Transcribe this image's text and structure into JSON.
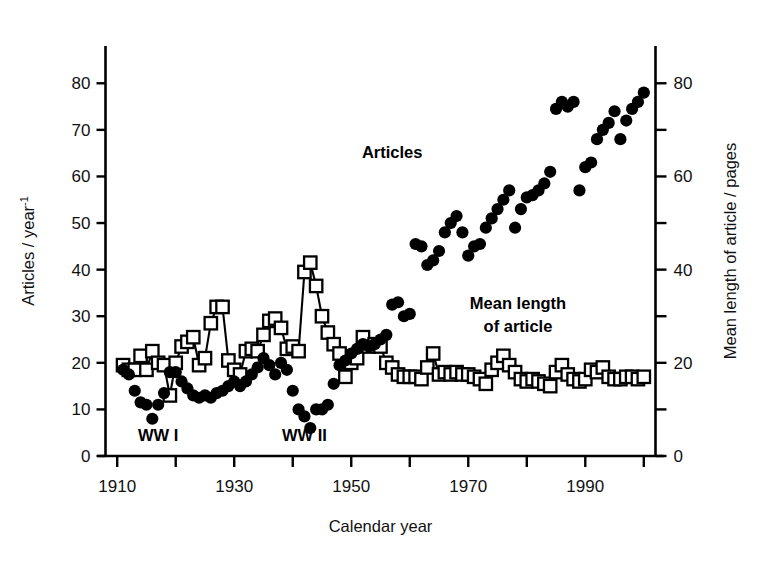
{
  "chart_data": {
    "type": "scatter",
    "title": "",
    "xlabel": "Calendar year",
    "ylabel_left": "Articles / year",
    "ylabel_left_exponent": "-1",
    "ylabel_right": "Mean length of article / pages",
    "xlim": [
      1908,
      2002
    ],
    "ylim_left": [
      0,
      88
    ],
    "ylim_right": [
      0,
      88
    ],
    "xticks_major": [
      1910,
      1930,
      1950,
      1970,
      1990
    ],
    "xticks_minor": [
      1920,
      1940,
      1960,
      1980,
      2000
    ],
    "xtick_labels": [
      "1910",
      "1930",
      "1950",
      "1970",
      "1990"
    ],
    "yticks_left": [
      0,
      10,
      20,
      30,
      40,
      50,
      60,
      70,
      80
    ],
    "ytick_labels_left": [
      "0",
      "10",
      "20",
      "30",
      "40",
      "50",
      "60",
      "70",
      "80"
    ],
    "yticks_right_major": [
      0,
      20,
      40,
      60,
      80
    ],
    "yticks_right_minor": [
      10,
      30,
      50,
      70
    ],
    "ytick_labels_right": [
      "0",
      "20",
      "40",
      "60",
      "80"
    ],
    "grid": false,
    "legend_position": "inline-annotations",
    "annotations": [
      {
        "text": "WW I",
        "x": 1917,
        "y": 3.2,
        "bold": true
      },
      {
        "text": "WW II",
        "x": 1942,
        "y": 3.2,
        "bold": true
      },
      {
        "text": "Articles",
        "x": 1957,
        "y": 64.0,
        "bold": true
      },
      {
        "text": "Mean length",
        "x": 1978.5,
        "y": 31.5,
        "bold": true
      },
      {
        "text": "of article",
        "x": 1978.5,
        "y": 26.6,
        "bold": true
      }
    ],
    "series": [
      {
        "name": "Articles",
        "label": "Articles",
        "marker": "filled-circle",
        "color": "#000000",
        "axis": "left",
        "units": "articles / year",
        "connected": false,
        "x": [
          1911,
          1912,
          1913,
          1914,
          1915,
          1916,
          1917,
          1918,
          1919,
          1920,
          1921,
          1922,
          1923,
          1924,
          1925,
          1926,
          1927,
          1928,
          1929,
          1930,
          1931,
          1932,
          1933,
          1934,
          1935,
          1936,
          1937,
          1938,
          1939,
          1940,
          1941,
          1942,
          1943,
          1944,
          1945,
          1946,
          1947,
          1948,
          1949,
          1950,
          1951,
          1952,
          1953,
          1954,
          1955,
          1956,
          1957,
          1958,
          1959,
          1960,
          1961,
          1962,
          1963,
          1964,
          1965,
          1966,
          1967,
          1968,
          1969,
          1970,
          1971,
          1972,
          1973,
          1974,
          1975,
          1976,
          1977,
          1978,
          1979,
          1980,
          1981,
          1982,
          1983,
          1984,
          1985,
          1986,
          1987,
          1988,
          1989,
          1990,
          1991,
          1992,
          1993,
          1994,
          1995,
          1996,
          1997,
          1998,
          1999,
          2000
        ],
        "y": [
          18.5,
          17.5,
          14.0,
          11.5,
          11.0,
          8.0,
          11.0,
          13.5,
          18.0,
          18.0,
          16.0,
          14.5,
          13.0,
          12.5,
          13.0,
          12.5,
          13.5,
          14.0,
          15.0,
          16.0,
          15.0,
          16.0,
          17.5,
          19.0,
          21.0,
          19.5,
          17.5,
          20.0,
          18.5,
          14.0,
          10.0,
          8.5,
          6.0,
          10.0,
          10.0,
          11.0,
          15.5,
          19.5,
          20.5,
          22.0,
          23.0,
          24.0,
          23.5,
          24.0,
          25.0,
          26.0,
          32.5,
          33.0,
          30.0,
          30.5,
          45.5,
          45.0,
          41.0,
          42.0,
          44.0,
          48.0,
          50.0,
          51.5,
          48.0,
          43.0,
          45.0,
          45.5,
          49.0,
          51.0,
          53.0,
          55.0,
          57.0,
          49.0,
          53.0,
          55.5,
          56.0,
          57.0,
          58.5,
          61.0,
          74.5,
          76.0,
          75.0,
          76.0,
          57.0,
          62.0,
          63.0,
          68.0,
          70.0,
          71.5,
          74.0,
          68.0,
          72.0,
          74.5,
          76.0,
          78.0
        ]
      },
      {
        "name": "Mean length of article",
        "label": "Mean length of article",
        "marker": "open-square",
        "color": "#000000",
        "axis": "right",
        "units": "pages",
        "connected": true,
        "x": [
          1911,
          1912,
          1913,
          1914,
          1915,
          1916,
          1917,
          1918,
          1919,
          1920,
          1921,
          1922,
          1923,
          1924,
          1925,
          1926,
          1927,
          1928,
          1929,
          1930,
          1931,
          1932,
          1933,
          1934,
          1935,
          1936,
          1937,
          1938,
          1939,
          1940,
          1941,
          1942,
          1943,
          1944,
          1945,
          1946,
          1947,
          1948,
          1949,
          1950,
          1951,
          1952,
          1953,
          1954,
          1955,
          1956,
          1957,
          1958,
          1959,
          1960,
          1961,
          1962,
          1963,
          1964,
          1965,
          1966,
          1967,
          1968,
          1969,
          1970,
          1971,
          1972,
          1973,
          1974,
          1975,
          1976,
          1977,
          1978,
          1979,
          1980,
          1981,
          1982,
          1983,
          1984,
          1985,
          1986,
          1987,
          1988,
          1989,
          1990,
          1991,
          1992,
          1993,
          1994,
          1995,
          1996,
          1997,
          1998,
          1999,
          2000
        ],
        "y": [
          19.5,
          18.5,
          18.5,
          21.5,
          18.5,
          22.5,
          20.0,
          19.5,
          13.0,
          20.0,
          23.5,
          24.5,
          25.5,
          19.5,
          21.0,
          28.5,
          32.0,
          32.0,
          20.5,
          18.5,
          17.5,
          22.5,
          23.0,
          22.5,
          26.0,
          29.0,
          29.5,
          27.5,
          23.0,
          23.5,
          22.5,
          39.5,
          41.5,
          36.5,
          30.0,
          26.5,
          24.0,
          22.0,
          17.0,
          20.0,
          21.0,
          25.5,
          23.5,
          24.0,
          23.5,
          20.0,
          19.0,
          17.5,
          17.0,
          17.0,
          17.0,
          16.5,
          19.0,
          22.0,
          17.5,
          18.0,
          17.5,
          18.0,
          17.5,
          17.5,
          17.0,
          16.5,
          15.5,
          18.5,
          20.0,
          21.5,
          19.5,
          18.0,
          16.5,
          16.0,
          16.5,
          16.0,
          15.5,
          15.0,
          18.0,
          19.5,
          17.5,
          16.5,
          16.0,
          16.5,
          18.5,
          18.0,
          19.0,
          17.0,
          16.5,
          16.5,
          17.0,
          17.0,
          16.5,
          17.0
        ]
      }
    ]
  }
}
